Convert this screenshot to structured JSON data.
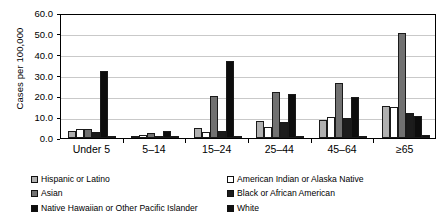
{
  "chart_data": {
    "type": "bar",
    "title": "",
    "xlabel": "",
    "ylabel": "Cases per 100,000",
    "ylim": [
      0,
      60
    ],
    "ytick_labels": [
      "0.0",
      "10.0",
      "20.0",
      "30.0",
      "40.0",
      "50.0",
      "60.0"
    ],
    "ytick_values": [
      0,
      10,
      20,
      30,
      40,
      50,
      60
    ],
    "grid": true,
    "legend_position": "bottom",
    "categories": [
      "Under 5",
      "5–14",
      "15–24",
      "25–44",
      "45–64",
      "≥65"
    ],
    "series": [
      {
        "name": "Hispanic or Latino",
        "color": "#b0b0b0",
        "values": [
          3.5,
          1.2,
          5.0,
          8.0,
          8.5,
          15.5
        ]
      },
      {
        "name": "American Indian or Alaska Native",
        "color": "#ffffff",
        "values": [
          4.2,
          1.5,
          2.8,
          5.5,
          10.2,
          15.0
        ]
      },
      {
        "name": "Asian",
        "color": "#717171",
        "values": [
          4.2,
          2.5,
          20.2,
          22.0,
          26.5,
          50.5
        ]
      },
      {
        "name": "Black or African American",
        "color": "#1c1c1c",
        "values": [
          3.0,
          1.0,
          3.3,
          7.5,
          9.8,
          12.0
        ]
      },
      {
        "name": "Native Hawaiian or Other Pacific Islander",
        "color": "#0d0d0d",
        "values": [
          32.0,
          3.5,
          37.0,
          21.0,
          19.7,
          10.5
        ]
      },
      {
        "name": "White",
        "color": "#111111",
        "values": [
          0.5,
          0.3,
          0.5,
          0.6,
          0.7,
          1.5
        ]
      }
    ]
  },
  "axes": {
    "y_title": "Cases per 100,000"
  },
  "legend": {
    "left_column": [
      {
        "label": "Hispanic or Latino",
        "color": "#b0b0b0"
      },
      {
        "label": "Asian",
        "color": "#717171"
      },
      {
        "label": "Native Hawaiian or Other Pacific Islander",
        "color": "#0d0d0d"
      }
    ],
    "right_column": [
      {
        "label": "American Indian or Alaska Native",
        "color": "#ffffff"
      },
      {
        "label": "Black or African American",
        "color": "#1c1c1c"
      },
      {
        "label": "White",
        "color": "#111111"
      }
    ]
  }
}
